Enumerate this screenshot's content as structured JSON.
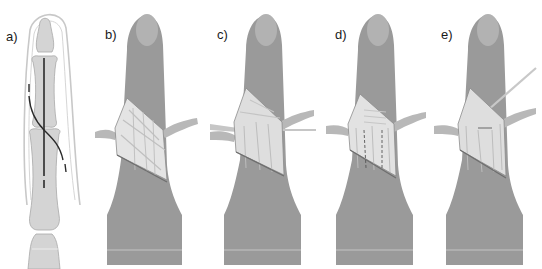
{
  "figure": {
    "panels": [
      {
        "id": "a",
        "label": "a)",
        "description": "Skeletal outline of finger with incision lines"
      },
      {
        "id": "b",
        "label": "b)",
        "description": "Finger with opened incision exposing tendons, retracted flaps"
      },
      {
        "id": "c",
        "label": "c)",
        "description": "Finger incision with instruments passed under tendon"
      },
      {
        "id": "d",
        "label": "d)",
        "description": "Finger incision showing tendons with dashed marking"
      },
      {
        "id": "e",
        "label": "e)",
        "description": "Finger incision with needle/instrument inserted from upper right"
      }
    ],
    "colors": {
      "skin": "#9a9a9a",
      "skin_dark": "#7e7e7e",
      "nail": "#b8b8b8",
      "bone": "#d4d4d4",
      "bone_outline": "#a8a8a8",
      "outline": "#c4c4c4",
      "incision_line": "#2a2a2a",
      "tissue_light": "#e6e6e6",
      "tissue_mid": "#c8c8c8"
    }
  }
}
